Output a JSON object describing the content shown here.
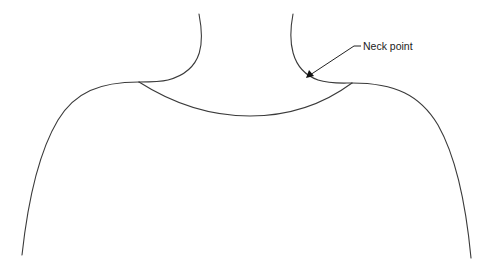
{
  "figure": {
    "annotations": [
      {
        "label": "Neck point",
        "target": "right-neck-point"
      }
    ],
    "colors": {
      "line": "#3a3a3a",
      "text": "#222222",
      "background": "#ffffff"
    }
  }
}
